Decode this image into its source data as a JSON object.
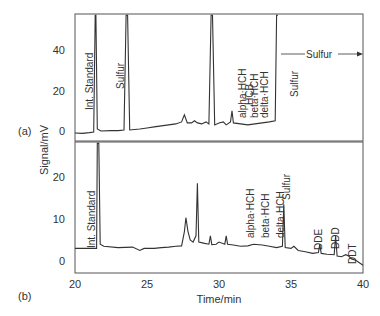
{
  "chart_data": {
    "type": "line",
    "title": "",
    "xlabel": "Time/min",
    "ylabel": "Signal/mV",
    "xlim": [
      20,
      40
    ],
    "x_ticks": [
      "20",
      "25",
      "30",
      "35",
      "40"
    ],
    "grid": false,
    "panels": [
      {
        "label": "(a)",
        "ylim": [
          -4,
          57
        ],
        "y_ticks": [
          "0",
          "20",
          "40"
        ],
        "series": [
          {
            "name": "Chromatogram (a)",
            "points": [
              [
                20.0,
                -1
              ],
              [
                20.5,
                -1.2
              ],
              [
                21.0,
                -0.8
              ],
              [
                21.3,
                -0.5
              ],
              [
                21.4,
                57
              ],
              [
                21.45,
                57
              ],
              [
                21.55,
                1
              ],
              [
                21.8,
                0
              ],
              [
                22.5,
                0.2
              ],
              [
                23.0,
                0.2
              ],
              [
                23.4,
                0.5
              ],
              [
                23.55,
                57
              ],
              [
                23.65,
                57
              ],
              [
                23.8,
                0.5
              ],
              [
                24.5,
                1
              ],
              [
                25.0,
                1.5
              ],
              [
                25.5,
                2
              ],
              [
                26.0,
                2.5
              ],
              [
                26.5,
                3
              ],
              [
                27.0,
                3.5
              ],
              [
                27.4,
                4.5
              ],
              [
                27.6,
                8
              ],
              [
                27.8,
                4
              ],
              [
                28.1,
                4
              ],
              [
                28.3,
                5
              ],
              [
                28.5,
                4
              ],
              [
                28.8,
                3.5
              ],
              [
                29.1,
                4.5
              ],
              [
                29.3,
                3.5
              ],
              [
                29.45,
                57
              ],
              [
                29.55,
                57
              ],
              [
                29.7,
                3
              ],
              [
                30.0,
                4
              ],
              [
                30.3,
                4.5
              ],
              [
                30.5,
                3
              ],
              [
                30.8,
                4.5
              ],
              [
                30.9,
                10
              ],
              [
                31.0,
                4
              ],
              [
                31.5,
                3.5
              ],
              [
                32.0,
                3
              ],
              [
                32.5,
                3.5
              ],
              [
                33.0,
                4
              ],
              [
                33.5,
                4.5
              ],
              [
                33.9,
                5
              ],
              [
                34.0,
                57
              ],
              [
                34.1,
                57
              ]
            ]
          }
        ],
        "annotations": [
          {
            "text": "Int. Standard",
            "x": 21.4
          },
          {
            "text": "Sulfur",
            "x": 23.55
          },
          {
            "text": "alpha-HCH",
            "x": 27.6
          },
          {
            "text": "HCB",
            "x": 28.1
          },
          {
            "text": "beta-HCH",
            "x": 28.6
          },
          {
            "text": "Sulfur",
            "x": 29.45
          },
          {
            "text": "delta-HCH",
            "x": 30.2
          },
          {
            "text": "Sulfur →",
            "x": 34.1
          }
        ]
      },
      {
        "label": "(b)",
        "ylim": [
          -3,
          28
        ],
        "y_ticks": [
          "0",
          "10",
          "20"
        ],
        "series": [
          {
            "name": "Chromatogram (b)",
            "points": [
              [
                20.0,
                3
              ],
              [
                21.5,
                3
              ],
              [
                21.55,
                28
              ],
              [
                21.65,
                28
              ],
              [
                21.75,
                4
              ],
              [
                22.0,
                3.5
              ],
              [
                23.0,
                3.2
              ],
              [
                24.0,
                3.3
              ],
              [
                24.5,
                2.5
              ],
              [
                24.8,
                3
              ],
              [
                25.5,
                3
              ],
              [
                26.0,
                3.2
              ],
              [
                26.5,
                3.3
              ],
              [
                27.0,
                3.5
              ],
              [
                27.4,
                3.6
              ],
              [
                27.6,
                7
              ],
              [
                27.7,
                10.3
              ],
              [
                27.85,
                7
              ],
              [
                28.0,
                5
              ],
              [
                28.2,
                4.5
              ],
              [
                28.4,
                6
              ],
              [
                28.5,
                18.5
              ],
              [
                28.6,
                4.5
              ],
              [
                29.0,
                4.2
              ],
              [
                29.3,
                4
              ],
              [
                29.4,
                6
              ],
              [
                29.5,
                3.9
              ],
              [
                29.8,
                4
              ],
              [
                30.0,
                4.5
              ],
              [
                30.4,
                4
              ],
              [
                30.5,
                6
              ],
              [
                30.6,
                4
              ],
              [
                31.0,
                3.8
              ],
              [
                31.5,
                3.5
              ],
              [
                32.0,
                3.6
              ],
              [
                32.4,
                4
              ],
              [
                33.0,
                3.8
              ],
              [
                33.5,
                3.5
              ],
              [
                34.0,
                3.2
              ],
              [
                34.4,
                3.5
              ],
              [
                34.5,
                13.5
              ],
              [
                34.6,
                3.2
              ],
              [
                35.0,
                3
              ],
              [
                35.2,
                3.5
              ],
              [
                35.5,
                2.5
              ],
              [
                36.0,
                2.2
              ],
              [
                36.5,
                1.8
              ],
              [
                36.9,
                2
              ],
              [
                37.0,
                4
              ],
              [
                37.1,
                1.8
              ],
              [
                37.5,
                1.6
              ],
              [
                38.0,
                1.5
              ],
              [
                38.1,
                6
              ],
              [
                38.2,
                1.2
              ],
              [
                38.5,
                1
              ],
              [
                38.8,
                1.5
              ],
              [
                39.0,
                1.2
              ],
              [
                39.2,
                0.5
              ],
              [
                39.5,
                0.2
              ],
              [
                40.0,
                -1
              ]
            ]
          }
        ],
        "annotations": [
          {
            "text": "Int. Standard",
            "x": 21.6
          },
          {
            "text": "alpha-HCH",
            "x": 28.0
          },
          {
            "text": "beta-HCH",
            "x": 29.4
          },
          {
            "text": "delta-HCH",
            "x": 30.5
          },
          {
            "text": "Sulfur",
            "x": 34.5
          },
          {
            "text": "DDE",
            "x": 37.0
          },
          {
            "text": "DDD",
            "x": 38.1
          },
          {
            "text": "DDT",
            "x": 39.1
          }
        ]
      }
    ]
  }
}
